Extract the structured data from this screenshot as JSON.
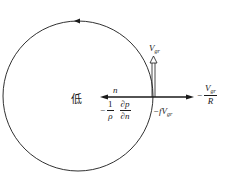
{
  "diagram": {
    "title": "",
    "center_label": "低",
    "normal_label": "n",
    "vgr_label": {
      "base": "V",
      "sub": "gr"
    },
    "pressure_gradient": {
      "sign": "−",
      "coef_num": "1",
      "coef_den": "ρ",
      "deriv_num": "∂p",
      "deriv_den": "∂n"
    },
    "coriolis": {
      "text": "−fV",
      "sub": "gr"
    },
    "centrifugal": {
      "sign": "−",
      "num_base": "V",
      "num_sub": "gr",
      "den": "R"
    },
    "colors": {
      "stroke": "#1a1a1a",
      "background": "#ffffff"
    }
  }
}
